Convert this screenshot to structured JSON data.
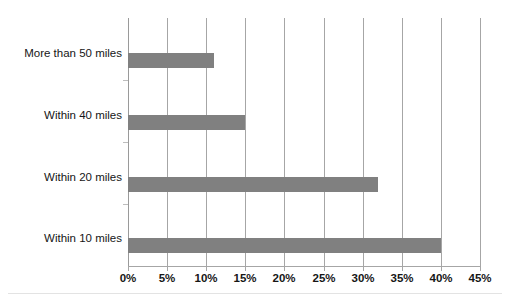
{
  "chart_data": {
    "type": "bar",
    "orientation": "horizontal",
    "title": "",
    "subtitle": "",
    "xlabel": "",
    "ylabel": "",
    "categories": [
      "Within 10 miles",
      "Within 20 miles",
      "Within 40 miles",
      "More than 50 miles"
    ],
    "values": [
      40,
      32,
      15,
      11
    ],
    "value_suffix": "%",
    "xlim": [
      0,
      45
    ],
    "xticks": [
      0,
      5,
      10,
      15,
      20,
      25,
      30,
      35,
      40,
      45
    ],
    "xtick_labels": [
      "0%",
      "5%",
      "10%",
      "15%",
      "20%",
      "25%",
      "30%",
      "35%",
      "40%",
      "45%"
    ],
    "grid": "vertical",
    "legend": "none",
    "series": [
      {
        "name": "",
        "values": [
          40,
          32,
          15,
          11
        ]
      }
    ],
    "colors": {
      "bar_fill": "#808080",
      "gridline": "#a6a6a6",
      "axis_line": "#a6a6a6",
      "text": "#161616",
      "background": "#ffffff"
    }
  },
  "plot_rows": [
    {
      "label": "More than 50 miles",
      "value": 11,
      "label_top": 47,
      "bar_top": 53
    },
    {
      "label": "Within 40 miles",
      "value": 15,
      "label_top": 109,
      "bar_top": 115
    },
    {
      "label": "Within 20 miles",
      "value": 32,
      "label_top": 171,
      "bar_top": 177
    },
    {
      "label": "Within 10 miles",
      "value": 40,
      "label_top": 232,
      "bar_top": 238
    }
  ]
}
